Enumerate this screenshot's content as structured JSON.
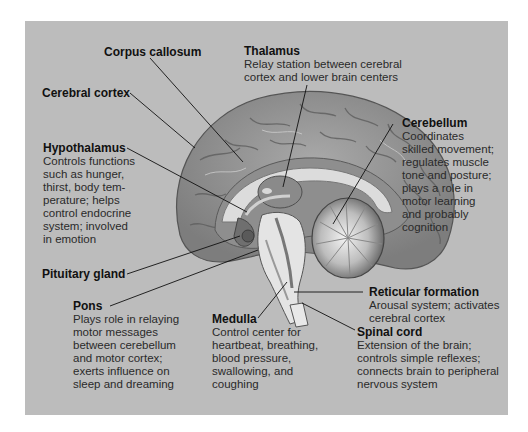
{
  "figure": {
    "background_color": "#bcbcbc",
    "labels": [
      {
        "id": "corpus-callosum",
        "title": "Corpus callosum",
        "description": ""
      },
      {
        "id": "thalamus",
        "title": "Thalamus",
        "description": "Relay station between cerebral\ncortex and lower brain centers"
      },
      {
        "id": "cerebral-cortex",
        "title": "Cerebral cortex",
        "description": ""
      },
      {
        "id": "cerebellum",
        "title": "Cerebellum",
        "description": "Coordinates\nskilled movement;\nregulates muscle\ntone and posture;\nplays a role in\nmotor learning\nand probably\ncognition"
      },
      {
        "id": "hypothalamus",
        "title": "Hypothalamus",
        "description": "Controls functions\nsuch as hunger,\nthirst, body tem-\nperature; helps\ncontrol endocrine\nsystem; involved\nin emotion"
      },
      {
        "id": "pituitary-gland",
        "title": "Pituitary gland",
        "description": ""
      },
      {
        "id": "reticular-formation",
        "title": "Reticular formation",
        "description": "Arousal system; activates\ncerebral cortex"
      },
      {
        "id": "pons",
        "title": "Pons",
        "description": "Plays role in relaying\nmotor messages\nbetween cerebellum\nand motor cortex;\nexerts influence on\nsleep and dreaming"
      },
      {
        "id": "medulla",
        "title": "Medulla",
        "description": "Control center for\nheartbeat, breathing,\nblood pressure,\nswallowing, and\ncoughing"
      },
      {
        "id": "spinal-cord",
        "title": "Spinal cord",
        "description": "Extension of the brain;\ncontrols simple reflexes;\nconnects brain to peripheral\nnervous system"
      }
    ]
  }
}
